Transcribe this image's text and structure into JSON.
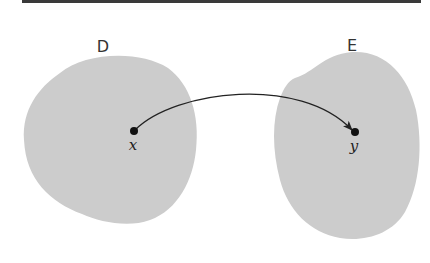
{
  "diagram": {
    "type": "function-mapping",
    "sets": [
      {
        "id": "D",
        "label": "D",
        "color": "#cccccc"
      },
      {
        "id": "E",
        "label": "E",
        "color": "#cccccc"
      }
    ],
    "points": [
      {
        "id": "x",
        "label": "x",
        "set": "D"
      },
      {
        "id": "y",
        "label": "y",
        "set": "E"
      }
    ],
    "arrows": [
      {
        "from": "x",
        "to": "y"
      }
    ],
    "colors": {
      "blob_fill": "#cccccc",
      "ink": "#222222",
      "top_rule": "#3a3a3a"
    }
  }
}
